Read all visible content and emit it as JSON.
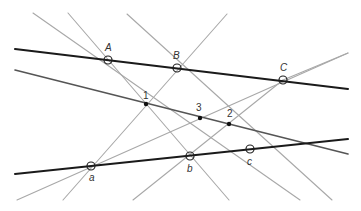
{
  "diagram": {
    "title": "",
    "colors": {
      "thick_line": "#1a1a1a",
      "pappus_line": "#555555",
      "cross_line": "#a8a8a8",
      "point_stroke": "#222222",
      "intersection_fill": "#111111"
    },
    "points_upper": [
      {
        "label": "A",
        "x": 108,
        "y": 60,
        "lx": 105,
        "ly": 51
      },
      {
        "label": "B",
        "x": 177,
        "y": 68,
        "lx": 173,
        "ly": 59
      },
      {
        "label": "C",
        "x": 283,
        "y": 80,
        "lx": 280,
        "ly": 71
      }
    ],
    "points_lower": [
      {
        "label": "a",
        "x": 91,
        "y": 166,
        "lx": 89,
        "ly": 181
      },
      {
        "label": "b",
        "x": 190,
        "y": 156,
        "lx": 187,
        "ly": 172
      },
      {
        "label": "c",
        "x": 250,
        "y": 149,
        "lx": 247,
        "ly": 165
      }
    ],
    "intersections": [
      {
        "label": "1",
        "x": 146,
        "y": 104,
        "lx": 143,
        "ly": 99
      },
      {
        "label": "3",
        "x": 200,
        "y": 118,
        "lx": 196,
        "ly": 111
      },
      {
        "label": "2",
        "x": 229,
        "y": 124,
        "lx": 227,
        "ly": 117
      }
    ],
    "lines": {
      "upper": {
        "x1": 15,
        "y1": 49,
        "x2": 348,
        "y2": 89
      },
      "lower": {
        "x1": 15,
        "y1": 174,
        "x2": 348,
        "y2": 139
      },
      "pappus": {
        "x1": 15,
        "y1": 70,
        "x2": 348,
        "y2": 154
      },
      "cross": [
        {
          "name": "A-b",
          "x1": 68,
          "y1": 13,
          "x2": 229,
          "y2": 200
        },
        {
          "name": "A-c",
          "x1": 33,
          "y1": 13,
          "x2": 300,
          "y2": 200
        },
        {
          "name": "B-a",
          "x1": 227,
          "y1": 14,
          "x2": 63,
          "y2": 200
        },
        {
          "name": "B-c",
          "x1": 127,
          "y1": 14,
          "x2": 332,
          "y2": 200
        },
        {
          "name": "a-C",
          "x1": 17,
          "y1": 200,
          "x2": 348,
          "y2": 53
        },
        {
          "name": "b-C",
          "x1": 133,
          "y1": 200,
          "x2": 283,
          "y2": 80
        },
        {
          "name": "a-C-ext",
          "x1": 283,
          "y1": 80,
          "x2": 348,
          "y2": 53
        }
      ]
    }
  }
}
